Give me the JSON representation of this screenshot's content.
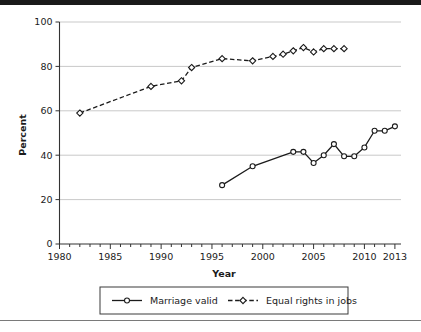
{
  "chart_data": {
    "type": "line",
    "title": "",
    "xlabel": "Year",
    "ylabel": "Percent",
    "xlim": [
      1980,
      2013.6
    ],
    "ylim": [
      0,
      100
    ],
    "ytick_values": [
      0,
      20,
      40,
      60,
      80,
      100
    ],
    "ytick_labels": [
      "0",
      "20",
      "40",
      "60",
      "80",
      "100"
    ],
    "xtick_values": [
      1980,
      1985,
      1990,
      1995,
      2000,
      2005,
      2010,
      2013
    ],
    "xtick_labels": [
      "1980",
      "1985",
      "1990",
      "1995",
      "2000",
      "2005",
      "2010",
      "2013"
    ],
    "xminor_step": 1,
    "grid": "horizontal",
    "legend_position": "below-axes",
    "series": [
      {
        "name": "Marriage valid",
        "style": "solid",
        "marker": "circle",
        "x": [
          1996,
          1999,
          2003,
          2004,
          2005,
          2006,
          2007,
          2008,
          2009,
          2010,
          2011,
          2012,
          2013
        ],
        "values": [
          26.5,
          35,
          41.5,
          41.5,
          36.5,
          40,
          45,
          39.5,
          39.5,
          43.5,
          51,
          51,
          53
        ]
      },
      {
        "name": "Equal rights in jobs",
        "style": "dashed",
        "marker": "diamond",
        "x": [
          1982,
          1989,
          1992,
          1993,
          1996,
          1999,
          2001,
          2002,
          2003,
          2004,
          2005,
          2006,
          2007,
          2008
        ],
        "values": [
          59,
          71,
          73.5,
          79.5,
          83.5,
          82.5,
          84.5,
          85.5,
          87,
          88.5,
          86.5,
          88,
          88,
          88
        ]
      }
    ]
  },
  "legend": {
    "items": [
      {
        "label": "Marriage valid",
        "style": "solid",
        "marker": "circle"
      },
      {
        "label": "Equal rights in jobs",
        "style": "dashed",
        "marker": "diamond"
      }
    ]
  },
  "colors": {
    "line": "#1b1b1b",
    "grid": "#c9c9c9",
    "axis": "#333333",
    "background": "#ffffff",
    "marker_fill": "#ffffff"
  }
}
